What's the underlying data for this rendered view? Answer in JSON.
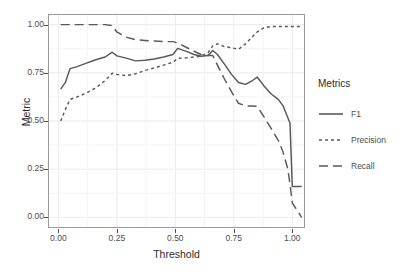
{
  "chart_data": {
    "type": "line",
    "title": "",
    "xlabel": "Threshold",
    "ylabel": "Metric",
    "xlim": [
      -0.04,
      1.05
    ],
    "ylim": [
      -0.05,
      1.05
    ],
    "xticks": [
      "0.00",
      "0.25",
      "0.50",
      "0.75",
      "1.00"
    ],
    "xtick_values": [
      0.0,
      0.25,
      0.5,
      0.75,
      1.0
    ],
    "yticks": [
      "0.00",
      "0.25",
      "0.50",
      "0.75",
      "1.00"
    ],
    "ytick_values": [
      0.0,
      0.25,
      0.5,
      0.75,
      1.0
    ],
    "grid": true,
    "legend_position": "right",
    "legend_title": "Metrics",
    "x": [
      0.01,
      0.03,
      0.05,
      0.08,
      0.12,
      0.16,
      0.2,
      0.23,
      0.25,
      0.29,
      0.33,
      0.37,
      0.41,
      0.45,
      0.49,
      0.51,
      0.55,
      0.58,
      0.61,
      0.64,
      0.66,
      0.68,
      0.71,
      0.74,
      0.77,
      0.8,
      0.83,
      0.85,
      0.88,
      0.91,
      0.94,
      0.96,
      0.98,
      0.99,
      1.0,
      1.04
    ],
    "series": [
      {
        "name": "F1",
        "dash": "solid",
        "color": "#595959",
        "values": [
          0.665,
          0.7,
          0.772,
          0.782,
          0.8,
          0.818,
          0.832,
          0.857,
          0.838,
          0.826,
          0.812,
          0.815,
          0.822,
          0.832,
          0.845,
          0.877,
          0.86,
          0.845,
          0.836,
          0.84,
          0.866,
          0.845,
          0.795,
          0.742,
          0.7,
          0.69,
          0.71,
          0.728,
          0.68,
          0.64,
          0.612,
          0.58,
          0.52,
          0.49,
          0.16,
          0.16
        ]
      },
      {
        "name": "Precision",
        "dash": "dotted",
        "color": "#595959",
        "values": [
          0.5,
          0.56,
          0.612,
          0.625,
          0.645,
          0.672,
          0.71,
          0.748,
          0.742,
          0.735,
          0.745,
          0.762,
          0.775,
          0.79,
          0.805,
          0.825,
          0.828,
          0.832,
          0.836,
          0.855,
          0.89,
          0.9,
          0.886,
          0.88,
          0.872,
          0.9,
          0.938,
          0.962,
          0.985,
          0.99,
          0.99,
          0.99,
          0.99,
          0.99,
          0.99,
          0.99
        ]
      },
      {
        "name": "Recall",
        "dash": "dashed",
        "color": "#595959",
        "values": [
          1.0,
          1.0,
          1.0,
          1.0,
          1.0,
          1.0,
          1.0,
          0.995,
          0.962,
          0.935,
          0.922,
          0.918,
          0.915,
          0.912,
          0.912,
          0.905,
          0.88,
          0.862,
          0.845,
          0.84,
          0.84,
          0.79,
          0.718,
          0.652,
          0.592,
          0.578,
          0.578,
          0.576,
          0.52,
          0.46,
          0.4,
          0.34,
          0.255,
          0.175,
          0.075,
          0.0
        ]
      }
    ]
  },
  "legend": {
    "title": "Metrics",
    "entries": [
      {
        "label": "F1",
        "key": "solid-line-key"
      },
      {
        "label": "Precision",
        "key": "dotted-line-key"
      },
      {
        "label": "Recall",
        "key": "dashed-line-key"
      }
    ]
  },
  "colors": {
    "line": "#595959",
    "panel_border": "#9a9a9a",
    "grid_major": "#ebebeb",
    "background": "#ffffff",
    "tick_text": "#4d4d4d",
    "axis_title": "#2b2b2b"
  }
}
